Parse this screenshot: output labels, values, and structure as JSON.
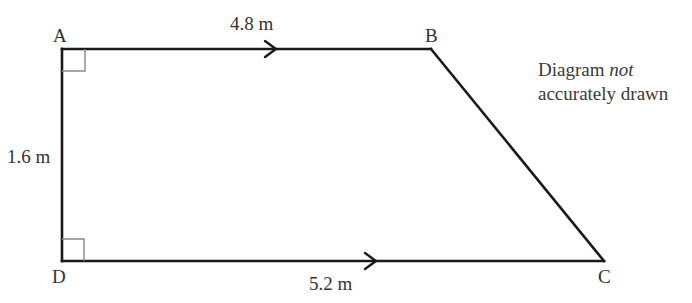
{
  "diagram": {
    "type": "trapezium",
    "vertices": {
      "A": {
        "label": "A",
        "x": 62,
        "y": 49
      },
      "B": {
        "label": "B",
        "x": 431,
        "y": 49
      },
      "C": {
        "label": "C",
        "x": 604,
        "y": 261
      },
      "D": {
        "label": "D",
        "x": 62,
        "y": 261
      }
    },
    "sides": {
      "AB": {
        "label": "4.8 m",
        "parallel_arrow": true
      },
      "DC": {
        "label": "5.2 m",
        "parallel_arrow": true
      },
      "AD": {
        "label": "1.6 m"
      }
    },
    "right_angles": [
      "A",
      "D"
    ],
    "note": {
      "line1_prefix": "Diagram ",
      "line1_italic": "not",
      "line2": "accurately drawn"
    },
    "colors": {
      "line": "#1a1a1a",
      "right_angle_marker": "#888888",
      "text": "#333333"
    }
  }
}
